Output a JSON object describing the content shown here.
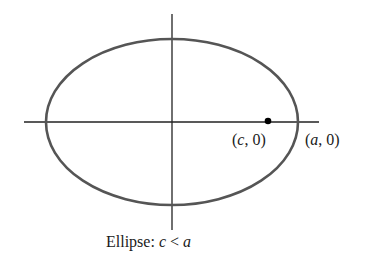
{
  "diagram": {
    "type": "ellipse-with-axes",
    "ellipse": {
      "cx": 172,
      "cy": 122,
      "rx": 126,
      "ry": 83,
      "stroke": "#555555"
    },
    "axes": {
      "horizontal": {
        "x1": 24,
        "x2": 319,
        "y": 122
      },
      "vertical": {
        "x": 172,
        "y1": 14,
        "y2": 230
      },
      "stroke": "#222222"
    },
    "focus_point": {
      "x": 268,
      "y": 121,
      "label_open": "(",
      "label_var": "c",
      "label_rest": ", 0)"
    },
    "vertex_label": {
      "label_open": "(",
      "label_var": "a",
      "label_rest": ", 0)"
    },
    "caption": {
      "prefix": "Ellipse: ",
      "var1": "c",
      "op": " < ",
      "var2": "a"
    }
  }
}
